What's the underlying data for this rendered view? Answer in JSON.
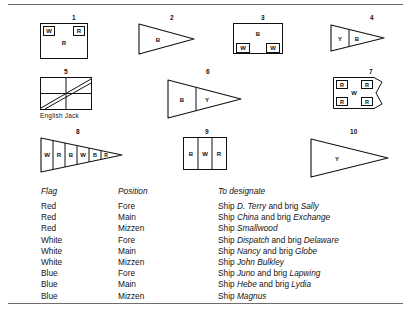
{
  "document": {
    "title": "Signal flag chart",
    "caption_english_jack": "English Jack"
  },
  "flags": [
    {
      "number": "1",
      "type": "rect-two-top-squares",
      "letters": [
        "W",
        "R",
        "R"
      ],
      "caption": ""
    },
    {
      "number": "2",
      "type": "pennant-plain",
      "letters": [
        "B"
      ],
      "caption": ""
    },
    {
      "number": "3",
      "type": "rect-two-bottom-squares",
      "letters": [
        "B",
        "W",
        "W"
      ],
      "caption": ""
    },
    {
      "number": "4",
      "type": "pennant-two-band",
      "letters": [
        "Y",
        "B"
      ],
      "caption": ""
    },
    {
      "number": "5",
      "type": "rect-jack",
      "letters": [],
      "caption": "English Jack"
    },
    {
      "number": "6",
      "type": "pennant-two-band",
      "letters": [
        "B",
        "Y"
      ],
      "caption": ""
    },
    {
      "number": "7",
      "type": "swallowtail-four-corners",
      "letters": [
        "R",
        "R",
        "W",
        "R",
        "R"
      ],
      "caption": ""
    },
    {
      "number": "8",
      "type": "pennant-six-band",
      "letters": [
        "W",
        "R",
        "B",
        "W",
        "B",
        "R"
      ],
      "caption": ""
    },
    {
      "number": "9",
      "type": "rect-three-stripes",
      "letters": [
        "B",
        "W",
        "R"
      ],
      "caption": ""
    },
    {
      "number": "10",
      "type": "pennant-plain",
      "letters": [
        "Y"
      ],
      "caption": ""
    }
  ],
  "table": {
    "headers": {
      "flag": "Flag",
      "position": "Position",
      "designate": "To  designate"
    },
    "rows": [
      {
        "flag": "Red",
        "position": "Fore",
        "designate_plain_1": "Ship ",
        "designate_italic_1": "D. Terry",
        "designate_plain_2": " and brig ",
        "designate_italic_2": "Sally",
        "designate_plain_3": ""
      },
      {
        "flag": "Red",
        "position": "Main",
        "designate_plain_1": "Ship ",
        "designate_italic_1": "China",
        "designate_plain_2": " and brig ",
        "designate_italic_2": "Exchange",
        "designate_plain_3": ""
      },
      {
        "flag": "Red",
        "position": "Mizzen",
        "designate_plain_1": "Ship ",
        "designate_italic_1": "Smallwood",
        "designate_plain_2": "",
        "designate_italic_2": "",
        "designate_plain_3": ""
      },
      {
        "flag": "White",
        "position": "Fore",
        "designate_plain_1": "Ship ",
        "designate_italic_1": "Dispatch",
        "designate_plain_2": " and brig ",
        "designate_italic_2": "Delaware",
        "designate_plain_3": ""
      },
      {
        "flag": "White",
        "position": "Main",
        "designate_plain_1": "Ship ",
        "designate_italic_1": "Nancy",
        "designate_plain_2": " and brig ",
        "designate_italic_2": "Globe",
        "designate_plain_3": ""
      },
      {
        "flag": "White",
        "position": "Mizzen",
        "designate_plain_1": "Ship ",
        "designate_italic_1": "John Bulkley",
        "designate_plain_2": "",
        "designate_italic_2": "",
        "designate_plain_3": ""
      },
      {
        "flag": "Blue",
        "position": "Fore",
        "designate_plain_1": "Ship ",
        "designate_italic_1": "Juno",
        "designate_plain_2": " and brig ",
        "designate_italic_2": "Lapwing",
        "designate_plain_3": ""
      },
      {
        "flag": "Blue",
        "position": "Main",
        "designate_plain_1": "Ship ",
        "designate_italic_1": "Hebe",
        "designate_plain_2": " and brig ",
        "designate_italic_2": "Lydia",
        "designate_plain_3": ""
      },
      {
        "flag": "Blue",
        "position": "Mizzen",
        "designate_plain_1": "Ship  ",
        "designate_italic_1": "Magnus",
        "designate_plain_2": "",
        "designate_italic_2": "",
        "designate_plain_3": ""
      }
    ]
  },
  "colors": {
    "ink": "#141414",
    "rule": "#6e6e6e",
    "paper": "#ffffff"
  }
}
